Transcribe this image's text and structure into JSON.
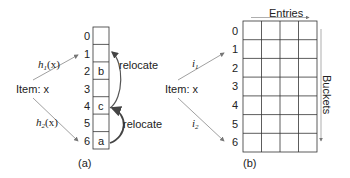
{
  "panel_a": {
    "caption": "(a)",
    "item_label": "Item: x",
    "hash1": {
      "name": "h",
      "sub": "1",
      "arg": "(x)"
    },
    "hash2": {
      "name": "h",
      "sub": "2",
      "arg": "(x)"
    },
    "indices": [
      "0",
      "1",
      "2",
      "3",
      "4",
      "5",
      "6"
    ],
    "cells": [
      "",
      "",
      "b",
      "",
      "c",
      "",
      "a"
    ],
    "relocate_labels": [
      "relocate",
      "relocate"
    ]
  },
  "panel_b": {
    "caption": "(b)",
    "item_label": "Item: x",
    "hash1": {
      "name": "i",
      "sub": "1"
    },
    "hash2": {
      "name": "i",
      "sub": "2"
    },
    "indices": [
      "0",
      "1",
      "2",
      "3",
      "4",
      "5",
      "6"
    ],
    "columns": 4,
    "entries_label": "Entries",
    "buckets_label": "Buckets"
  },
  "colors": {
    "line": "#333333",
    "arrow_gray": "#888888"
  }
}
